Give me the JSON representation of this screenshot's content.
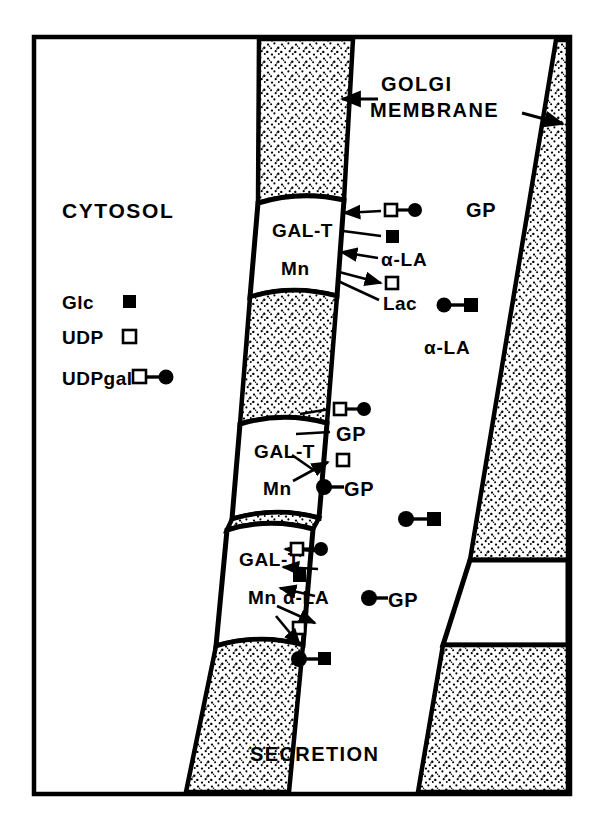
{
  "figure": {
    "title_region": "Golgi membrane lactose / glycoprotein galactosylation diagram",
    "compartments": {
      "cytosol_label": "CYTOSOL",
      "golgi_membrane_label": "GOLGI\nMEMBRANE",
      "golgi_membrane_label_line1": "GOLGI",
      "golgi_membrane_label_line2": "MEMBRANE",
      "secretion_label": "SECRETION"
    },
    "legend": {
      "title": "",
      "items": [
        {
          "label": "Glc",
          "symbol": "filled-square"
        },
        {
          "label": "UDP",
          "symbol": "open-square"
        },
        {
          "label": "UDPgal",
          "symbol": "open-square-filled-circle"
        }
      ]
    },
    "enzyme_boxes": [
      {
        "id": "gal-t-top",
        "line1": "GAL-T",
        "line2": "Mn"
      },
      {
        "id": "gal-t-middle",
        "line1": "GAL-T",
        "line2": "Mn"
      },
      {
        "id": "gal-t-bottom",
        "line1": "GAL-T",
        "line2": "Mn"
      },
      {
        "id": "gal-t-right-blank",
        "line1": "",
        "line2": ""
      }
    ],
    "reactions": [
      {
        "box": "gal-t-top",
        "inputs": [
          {
            "label": "",
            "symbol": "open-square-filled-circle"
          },
          {
            "label": "α-LA",
            "symbol": "text"
          }
        ],
        "outputs": [
          {
            "label": "",
            "symbol": "filled-square"
          },
          {
            "label": "",
            "symbol": "open-square"
          },
          {
            "label": "Lac",
            "symbol": "text"
          }
        ]
      },
      {
        "box": "gal-t-middle",
        "inputs": [
          {
            "label": "",
            "symbol": "open-square-filled-circle"
          },
          {
            "label": "GP",
            "symbol": "text"
          }
        ],
        "outputs": [
          {
            "label": "",
            "symbol": "open-square"
          },
          {
            "label": "GP",
            "symbol": "filled-circle-text"
          }
        ]
      },
      {
        "box": "gal-t-bottom",
        "inputs": [
          {
            "label": "",
            "symbol": "open-square-filled-circle"
          },
          {
            "label": "",
            "symbol": "filled-square"
          },
          {
            "label": "α-LA",
            "symbol": "text"
          }
        ],
        "outputs": [
          {
            "label": "",
            "symbol": "open-square"
          },
          {
            "label": "",
            "symbol": "filled-circle-filled-square"
          }
        ]
      }
    ],
    "lumen_labels": [
      {
        "id": "gp-upper",
        "text": "GP"
      },
      {
        "id": "alpha-la-mid",
        "text": "α-LA"
      },
      {
        "id": "gp-lower",
        "text": "GP"
      }
    ],
    "free_molecules": [
      {
        "id": "lactose-upper",
        "symbol": "filled-circle-filled-square"
      },
      {
        "id": "lactose-mid",
        "symbol": "filled-circle-filled-square"
      }
    ],
    "annotation_arrows": [
      {
        "id": "arrow-to-left-membrane",
        "points_to": "left golgi membrane"
      },
      {
        "id": "arrow-to-right-membrane",
        "points_to": "right golgi membrane"
      }
    ],
    "symbol_key": {
      "filled-square": "Glc (glucose)",
      "open-square": "UDP",
      "filled-circle": "galactose",
      "open-square-filled-circle": "UDPgal",
      "filled-circle-filled-square": "Lac (lactose)"
    },
    "colors": {
      "ink": "#000000",
      "background": "#ffffff",
      "stipple": "#000000"
    }
  }
}
